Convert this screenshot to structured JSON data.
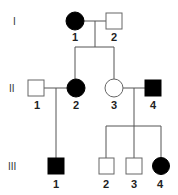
{
  "colors": {
    "affected": "#000000",
    "unaffected": "#ffffff",
    "line": "#555555"
  },
  "generations": [
    {
      "label": "I",
      "y": 21
    },
    {
      "label": "II",
      "y": 88
    },
    {
      "label": "III",
      "y": 166
    }
  ],
  "individuals": [
    {
      "id": "I-1",
      "gen": "I",
      "number": "1",
      "sex": "female",
      "affected": true,
      "cx": 75,
      "cy": 21
    },
    {
      "id": "I-2",
      "gen": "I",
      "number": "2",
      "sex": "male",
      "affected": false,
      "cx": 114,
      "cy": 21
    },
    {
      "id": "II-1",
      "gen": "II",
      "number": "1",
      "sex": "male",
      "affected": false,
      "cx": 36,
      "cy": 88
    },
    {
      "id": "II-2",
      "gen": "II",
      "number": "2",
      "sex": "female",
      "affected": true,
      "cx": 76,
      "cy": 88
    },
    {
      "id": "II-3",
      "gen": "II",
      "number": "3",
      "sex": "female",
      "affected": false,
      "cx": 114,
      "cy": 88
    },
    {
      "id": "II-4",
      "gen": "II",
      "number": "4",
      "sex": "male",
      "affected": true,
      "cx": 153,
      "cy": 88
    },
    {
      "id": "III-1",
      "gen": "III",
      "number": "1",
      "sex": "male",
      "affected": true,
      "cx": 55,
      "cy": 166
    },
    {
      "id": "III-2",
      "gen": "III",
      "number": "2",
      "sex": "male",
      "affected": false,
      "cx": 106,
      "cy": 166
    },
    {
      "id": "III-3",
      "gen": "III",
      "number": "3",
      "sex": "male",
      "affected": false,
      "cx": 134,
      "cy": 166
    },
    {
      "id": "III-4",
      "gen": "III",
      "number": "4",
      "sex": "female",
      "affected": true,
      "cx": 160,
      "cy": 166
    }
  ],
  "labels": {
    "gen_I": "I",
    "gen_II": "II",
    "gen_III": "III",
    "I1": "1",
    "I2": "2",
    "II1": "1",
    "II2": "2",
    "II3": "3",
    "II4": "4",
    "III1": "1",
    "III2": "2",
    "III3": "3",
    "III4": "4"
  }
}
